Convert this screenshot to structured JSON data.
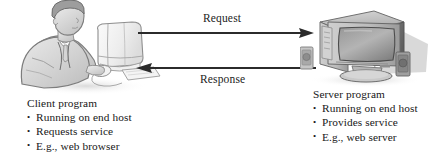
{
  "figure": {
    "type": "client-server-diagram",
    "background_color": "#ffffff",
    "line_color": "#262626"
  },
  "arrows": [
    {
      "id": "request",
      "label": "Request",
      "direction": "left-to-right",
      "from": "client",
      "to": "server"
    },
    {
      "id": "response",
      "label": "Response",
      "direction": "right-to-left",
      "from": "server",
      "to": "client"
    }
  ],
  "client": {
    "illustration_name": "person-at-computer-illustration",
    "title": "Client program",
    "bullet_glyph": "•",
    "bullets": [
      "Running on end host",
      "Requests service",
      "E.g., web browser"
    ]
  },
  "server": {
    "illustration_name": "desktop-computer-illustration",
    "title": "Server program",
    "bullet_glyph": "•",
    "bullets": [
      "Running on end host",
      "Provides service",
      "E.g., web server"
    ]
  }
}
